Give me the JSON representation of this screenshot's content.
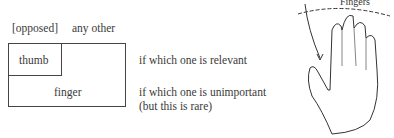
{
  "header": {
    "opposed_label": "[opposed]",
    "other_label": "any other"
  },
  "boxes": {
    "thumb_label": "thumb",
    "finger_label": "finger"
  },
  "notes": {
    "relevant": "if which one is relevant",
    "unimportant_line1": "if which one is unimportant",
    "unimportant_line2": "(but this is rare)"
  },
  "illustration": {
    "label": "Fingers",
    "icon": "hand-icon"
  }
}
